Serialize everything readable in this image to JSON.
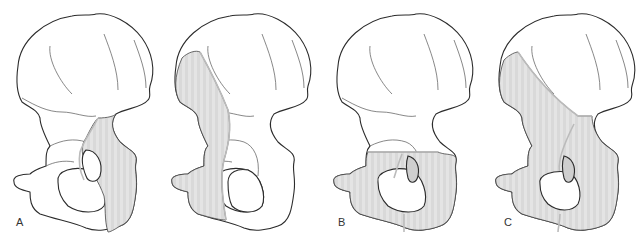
{
  "figure": {
    "shade_color": "#d6d6d6",
    "outline_color": "#2b2b2b",
    "panels": [
      {
        "id": "A1",
        "label": "A",
        "shaded_region": "ischium and posterior column"
      },
      {
        "id": "A2",
        "label": "",
        "shaded_region": "anterior iliac wing and anterior column"
      },
      {
        "id": "B",
        "label": "B",
        "shaded_region": "acetabulum and pubis/ischium below acetabular roof"
      },
      {
        "id": "C",
        "label": "C",
        "shaded_region": "anterior ilium, acetabulum and ischiopubic region"
      }
    ]
  }
}
